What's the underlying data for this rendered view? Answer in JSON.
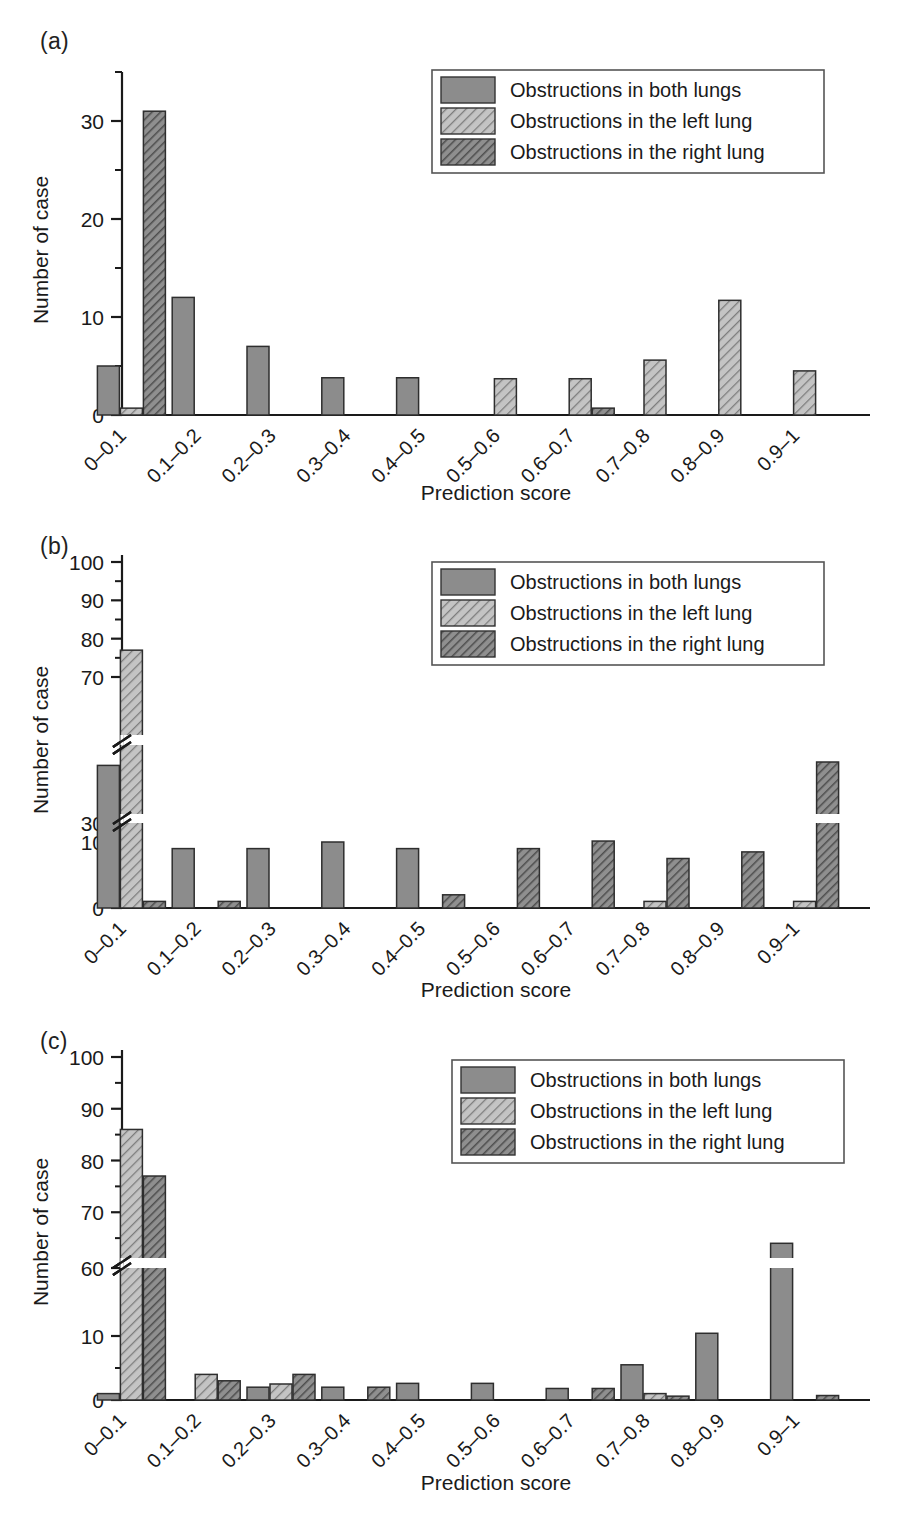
{
  "figure": {
    "panels": [
      "(a)",
      "(b)",
      "(c)"
    ],
    "xlabel": "Prediction score",
    "ylabel": "Number of case",
    "categories": [
      "0–0.1",
      "0.1–0.2",
      "0.2–0.3",
      "0.3–0.4",
      "0.4–0.5",
      "0.5–0.6",
      "0.6–0.7",
      "0.7–0.8",
      "0.8–0.9",
      "0.9–1"
    ],
    "legend": [
      {
        "label": "Obstructions in both lungs",
        "pattern": "solid-gray",
        "color": "#8c8c8c"
      },
      {
        "label": "Obstructions in the left lung",
        "pattern": "light-hatch",
        "color": "#bdbdbd"
      },
      {
        "label": "Obstructions in the right lung",
        "pattern": "dark-hatch",
        "color": "#6e6e6e"
      }
    ]
  },
  "chart_data": [
    {
      "type": "bar",
      "panel": "(a)",
      "title": "",
      "xlabel": "Prediction score",
      "ylabel": "Number of case",
      "categories": [
        "0–0.1",
        "0.1–0.2",
        "0.2–0.3",
        "0.3–0.4",
        "0.4–0.5",
        "0.5–0.6",
        "0.6–0.7",
        "0.7–0.8",
        "0.8–0.9",
        "0.9–1"
      ],
      "yticks": [
        0,
        10,
        20,
        30
      ],
      "yminorticks": [
        5,
        15,
        25,
        35
      ],
      "ylim": [
        0,
        35
      ],
      "axis_break": false,
      "grid": false,
      "legend_position": "top-right",
      "series": [
        {
          "name": "Obstructions in both lungs",
          "values": [
            5,
            12,
            7,
            3.8,
            3.8,
            0,
            0,
            0,
            0,
            0
          ]
        },
        {
          "name": "Obstructions in the left lung",
          "values": [
            0.7,
            0,
            0,
            0,
            0,
            3.7,
            3.7,
            5.6,
            11.7,
            4.5
          ]
        },
        {
          "name": "Obstructions in the right lung",
          "values": [
            31,
            0,
            0,
            0,
            0,
            0,
            0.7,
            0,
            0,
            0
          ]
        }
      ]
    },
    {
      "type": "bar",
      "panel": "(b)",
      "title": "",
      "xlabel": "Prediction score",
      "ylabel": "Number of case",
      "yticks": [
        0,
        10,
        30,
        70,
        80,
        90,
        100
      ],
      "yminorticks": [
        5,
        75,
        85,
        95
      ],
      "ylim": [
        0,
        100
      ],
      "axis_break": true,
      "axis_break_ranges": [
        [
          10,
          30
        ],
        [
          30,
          70
        ]
      ],
      "grid": false,
      "legend_position": "top-right",
      "categories": [
        "0–0.1",
        "0.1–0.2",
        "0.2–0.3",
        "0.3–0.4",
        "0.4–0.5",
        "0.5–0.6",
        "0.6–0.7",
        "0.7–0.8",
        "0.8–0.9",
        "0.9–1"
      ],
      "series": [
        {
          "name": "Obstructions in both lungs",
          "values": [
            44,
            9,
            9,
            10,
            9,
            0,
            0,
            0,
            0,
            0
          ]
        },
        {
          "name": "Obstructions in the left lung",
          "values": [
            77,
            0,
            0,
            0,
            0,
            0,
            0,
            1,
            0,
            1
          ]
        },
        {
          "name": "Obstructions in the right lung",
          "values": [
            1,
            1,
            0,
            0,
            2,
            9,
            11,
            7.5,
            8.5,
            45
          ]
        }
      ]
    },
    {
      "type": "bar",
      "panel": "(c)",
      "title": "",
      "xlabel": "Prediction score",
      "ylabel": "Number of case",
      "yticks": [
        0,
        10,
        60,
        70,
        80,
        90,
        100
      ],
      "yminorticks": [
        5,
        65,
        75,
        85,
        95
      ],
      "ylim": [
        0,
        100
      ],
      "axis_break": true,
      "axis_break_ranges": [
        [
          10,
          60
        ]
      ],
      "grid": false,
      "legend_position": "top-right",
      "categories": [
        "0–0.1",
        "0.1–0.2",
        "0.2–0.3",
        "0.3–0.4",
        "0.4–0.5",
        "0.5–0.6",
        "0.6–0.7",
        "0.7–0.8",
        "0.8–0.9",
        "0.9–1"
      ],
      "series": [
        {
          "name": "Obstructions in both lungs",
          "values": [
            1,
            0,
            2,
            2,
            2.6,
            2.6,
            1.8,
            5.5,
            12,
            64
          ]
        },
        {
          "name": "Obstructions in the left lung",
          "values": [
            86,
            4,
            2.5,
            0,
            0,
            0,
            0,
            1,
            0,
            0
          ]
        },
        {
          "name": "Obstructions in the right lung",
          "values": [
            77,
            3,
            4,
            2,
            0,
            0,
            1.8,
            0.6,
            0,
            0.7
          ]
        }
      ]
    }
  ]
}
